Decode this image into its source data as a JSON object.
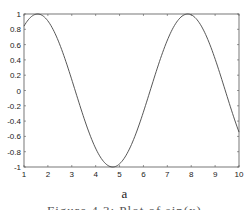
{
  "chart_data": {
    "type": "line",
    "title": "",
    "xlabel": "",
    "ylabel": "",
    "function": "sin(x)",
    "xlim": [
      1,
      10
    ],
    "ylim": [
      -1,
      1
    ],
    "grid": false,
    "legend": null,
    "x_ticks": [
      1,
      2,
      3,
      4,
      5,
      6,
      7,
      8,
      9,
      10
    ],
    "y_ticks": [
      -1,
      -0.8,
      -0.6,
      -0.4,
      -0.2,
      0,
      0.2,
      0.4,
      0.6,
      0.8,
      1
    ],
    "y_tick_labels": [
      "-1",
      "-0.8",
      "-0.6",
      "-0.4",
      "-0.2",
      "0",
      "0.2",
      "0.4",
      "0.6",
      "0.8",
      "1"
    ],
    "series": [
      {
        "name": "sin(x)",
        "color": "#444444",
        "x": [
          1,
          1.5,
          2,
          2.5,
          3,
          3.5,
          4,
          4.5,
          5,
          5.5,
          6,
          6.5,
          7,
          7.5,
          8,
          8.5,
          9,
          9.5,
          10
        ],
        "y": [
          0.841,
          0.997,
          0.909,
          0.598,
          0.141,
          -0.351,
          -0.757,
          -0.978,
          -0.959,
          -0.706,
          -0.279,
          0.215,
          0.657,
          0.938,
          0.989,
          0.798,
          0.412,
          -0.075,
          -0.544
        ]
      }
    ]
  },
  "captions": {
    "subfigure_label": "a",
    "figure_caption_partial": "Figure 4.3: Plot of sin(x)"
  }
}
